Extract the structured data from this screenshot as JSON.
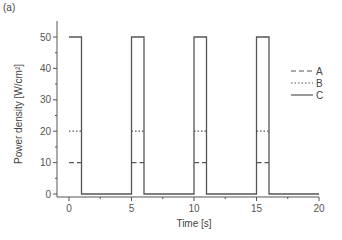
{
  "panel_label": "(a)",
  "chart_data": {
    "type": "line",
    "title": "",
    "xlabel": "Time [s]",
    "ylabel": "Power density [W/cm²]",
    "xlim": [
      -1.2,
      20
    ],
    "ylim": [
      -1.5,
      54
    ],
    "xticks": [
      0,
      5,
      10,
      15,
      20
    ],
    "xtick_labels": [
      "0",
      "5",
      "10",
      "15",
      "20"
    ],
    "xminor": [
      2.5,
      7.5,
      12.5,
      17.5
    ],
    "yticks": [
      0,
      10,
      20,
      30,
      40,
      50
    ],
    "ytick_labels": [
      "0",
      "10",
      "20",
      "30",
      "40",
      "50"
    ],
    "yminor": [
      5,
      15,
      25,
      35,
      45
    ],
    "grid": false,
    "legend_position": "right",
    "series": [
      {
        "name": "A",
        "style": "dashed",
        "color": "#555555",
        "x": [
          0,
          1,
          1,
          5,
          5,
          6,
          6,
          10,
          10,
          11,
          11,
          15,
          15,
          16,
          16,
          20
        ],
        "y": [
          10,
          10,
          0,
          0,
          10,
          10,
          0,
          0,
          10,
          10,
          0,
          0,
          10,
          10,
          0,
          0
        ]
      },
      {
        "name": "B",
        "style": "dotted",
        "color": "#555555",
        "x": [
          0,
          1,
          1,
          5,
          5,
          6,
          6,
          10,
          10,
          11,
          11,
          15,
          15,
          16,
          16,
          20
        ],
        "y": [
          20,
          20,
          0,
          0,
          20,
          20,
          0,
          0,
          20,
          20,
          0,
          0,
          20,
          20,
          0,
          0
        ]
      },
      {
        "name": "C",
        "style": "solid",
        "color": "#555555",
        "x": [
          0,
          1,
          1,
          5,
          5,
          6,
          6,
          10,
          10,
          11,
          11,
          15,
          15,
          16,
          16,
          20
        ],
        "y": [
          50,
          50,
          0,
          0,
          50,
          50,
          0,
          0,
          50,
          50,
          0,
          0,
          50,
          50,
          0,
          0
        ]
      }
    ]
  }
}
